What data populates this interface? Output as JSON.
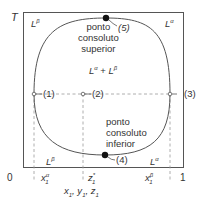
{
  "axes": {
    "y_label": "T",
    "x_label_parts": [
      "x",
      "1",
      ", y",
      "1",
      ", z",
      "1"
    ],
    "x_origin": "0",
    "x_end": "1"
  },
  "regions": {
    "top_left": {
      "base": "L",
      "sup": "β"
    },
    "top_right": {
      "base": "L",
      "sup": "α"
    },
    "middle": {
      "a": "L",
      "a_sup": "α",
      "plus": " + ",
      "b": "L",
      "b_sup": "β"
    },
    "bottom_left": {
      "base": "L",
      "sup": "β"
    },
    "bottom_right": {
      "base": "L",
      "sup": "α"
    }
  },
  "annotations": {
    "upper_point": {
      "lines": [
        "ponto",
        "consoluto",
        "superior"
      ],
      "marker": "(5)"
    },
    "lower_point": {
      "lines": [
        "ponto",
        "consoluto",
        "inferior"
      ],
      "marker": "(4)"
    },
    "point_1": "(1)",
    "point_2": "(2)",
    "point_3": "(3)"
  },
  "ticks": {
    "x1_alpha": {
      "base": "x",
      "sup": "α",
      "sub": "1"
    },
    "z1_star": {
      "base": "z",
      "sup": "*",
      "sub": "1"
    },
    "x1_beta": {
      "base": "x",
      "sup": "β",
      "sub": "1"
    }
  },
  "colors": {
    "line": "#555555",
    "dash": "#999999",
    "dot": "#111111"
  }
}
